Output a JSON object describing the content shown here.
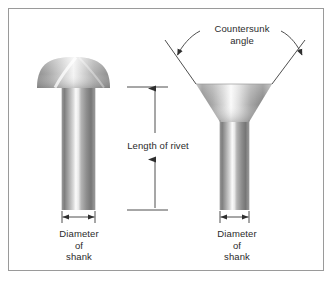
{
  "figure": {
    "background_color": "#ffffff",
    "border_color": "#9a9a9a",
    "line_color": "#3a3a3a",
    "text_color": "#2b2b2b"
  },
  "labels": {
    "countersunk_angle": "Countersunk\nangle",
    "length_of_rivet": "Length of rivet",
    "diameter_of_shank_left": "Diameter\nof\nshank",
    "diameter_of_shank_right": "Diameter\nof\nshank"
  },
  "parts": {
    "left_rivet": {
      "name": "round head rivet",
      "head_type": "dome",
      "head_left": 37,
      "head_right": 110,
      "head_top": 57,
      "head_bottom": 88,
      "shank_left": 62,
      "shank_right": 95,
      "shank_top": 88,
      "shank_bottom": 210
    },
    "right_rivet": {
      "name": "countersunk head rivet",
      "head_type": "countersunk",
      "head_top_left": 196,
      "head_top_right": 272,
      "head_top": 84,
      "head_bottom": 122,
      "shank_left": 220,
      "shank_right": 249,
      "shank_top": 122,
      "shank_bottom": 210
    }
  },
  "dimensions": {
    "length_of_rivet": {
      "top_y": 87,
      "bottom_y": 210,
      "line_x": 155,
      "extension_left": 127,
      "extension_right": 168
    },
    "diameter_left": {
      "y": 217,
      "x1": 62,
      "x2": 95
    },
    "diameter_right": {
      "y": 217,
      "x1": 220,
      "x2": 249
    },
    "countersunk_angle": {
      "left_line_start_x": 165,
      "left_line_start_y": 40,
      "right_line_start_x": 305,
      "right_line_start_y": 40
    }
  }
}
